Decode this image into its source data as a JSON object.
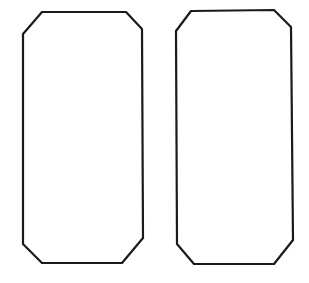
{
  "canvas": {
    "width": 309,
    "height": 283,
    "background": "#ffffff"
  },
  "style": {
    "stroke_color": "#1a1a1a",
    "stroke_width": 2.2
  },
  "shapes": [
    {
      "name": "left-chamfered-rectangle",
      "type": "octagon-outline",
      "points": [
        [
          42,
          12
        ],
        [
          126,
          12
        ],
        [
          142,
          29
        ],
        [
          143,
          238
        ],
        [
          122,
          263
        ],
        [
          42,
          263
        ],
        [
          23,
          244
        ],
        [
          23,
          34
        ]
      ]
    },
    {
      "name": "right-chamfered-rectangle",
      "type": "octagon-outline",
      "points": [
        [
          191,
          11
        ],
        [
          274,
          10
        ],
        [
          291,
          27
        ],
        [
          293,
          240
        ],
        [
          274,
          264
        ],
        [
          194,
          264
        ],
        [
          177,
          244
        ],
        [
          176,
          31
        ]
      ]
    }
  ]
}
